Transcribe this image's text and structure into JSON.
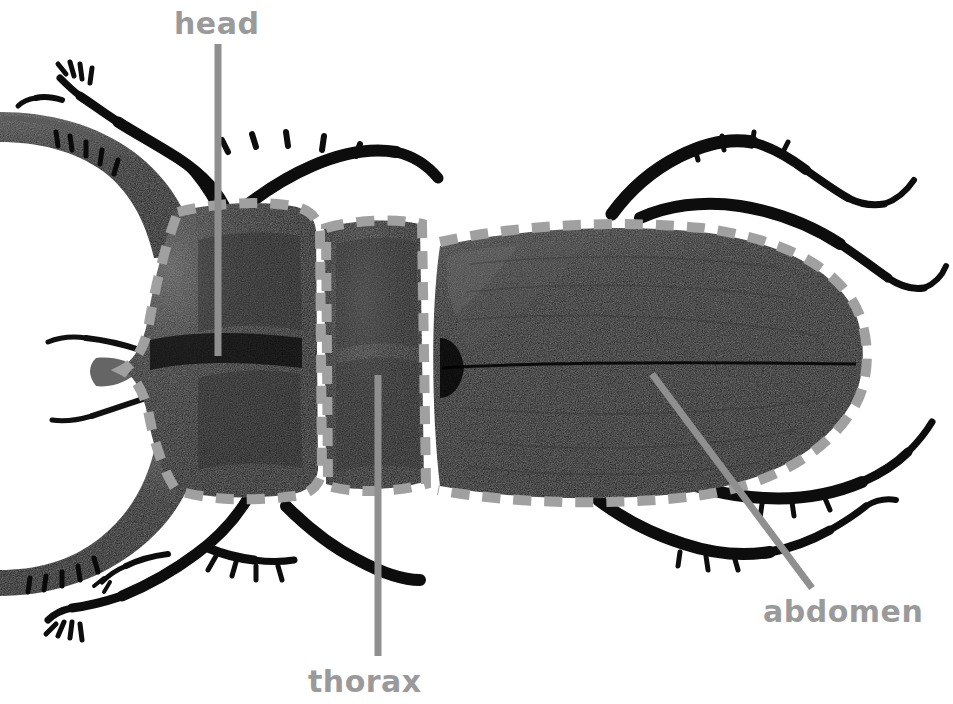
{
  "figure": {
    "view": "dorsal",
    "background_color": "#ffffff",
    "annotation_color": "#9a9a9a",
    "leader_line_color": "#8f8f8f",
    "dash_outline_color": "#9d9d9d",
    "body_color": "#121212"
  },
  "labels": {
    "head": "head",
    "thorax": "thorax",
    "abdomen": "abdomen"
  },
  "regions": [
    {
      "id": "head",
      "name": "head",
      "outline_style": "dashed",
      "leader": {
        "type": "straight-vertical",
        "x": 218,
        "y_start": 44,
        "y_end": 356
      }
    },
    {
      "id": "thorax",
      "name": "thorax",
      "outline_style": "dashed",
      "leader": {
        "type": "straight-vertical",
        "x": 378,
        "y_start": 375,
        "y_end": 656
      }
    },
    {
      "id": "abdomen",
      "name": "abdomen",
      "outline_style": "dashed",
      "leader": {
        "type": "straight-diagonal",
        "x_start": 652,
        "y_start": 374,
        "x_end": 812,
        "y_end": 588
      }
    }
  ],
  "anatomy_parts": [
    "mandibles",
    "antennae",
    "head",
    "pronotum",
    "elytra",
    "legs",
    "tarsal-claws"
  ]
}
